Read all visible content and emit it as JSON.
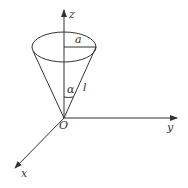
{
  "diagram": {
    "labels": {
      "z_axis": "z",
      "y_axis": "y",
      "x_axis": "x",
      "origin": "O",
      "radius": "a",
      "half_angle": "α",
      "slant_height": "l"
    },
    "colors": {
      "line": "#333333",
      "background": "#ffffff"
    }
  }
}
